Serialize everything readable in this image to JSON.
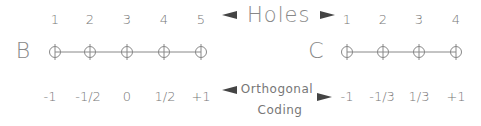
{
  "factor_b": {
    "label": "B",
    "holes": [
      "1",
      "2",
      "3",
      "4",
      "5"
    ],
    "coding": [
      "-1",
      "-1/2",
      "0",
      "1/2",
      "+1"
    ]
  },
  "factor_c": {
    "label": "C",
    "holes": [
      "1",
      "2",
      "3",
      "4"
    ],
    "coding": [
      "-1",
      "-1/3",
      "1/3",
      "+1"
    ]
  },
  "center_labels": {
    "holes": "Holes",
    "coding_line1": "Orthogonal",
    "coding_line2": "Coding"
  },
  "colors": {
    "line": "#888888",
    "text": "#777777",
    "arrow": "#444444"
  }
}
